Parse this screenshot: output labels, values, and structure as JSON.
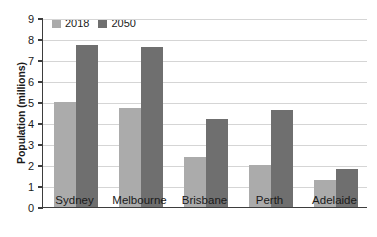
{
  "chart_data": {
    "type": "bar",
    "title": "",
    "xlabel": "",
    "ylabel": "Population (millions)",
    "categories": [
      "Sydney",
      "Melbourne",
      "Brisbane",
      "Perth",
      "Adelaide"
    ],
    "series": [
      {
        "name": "2018",
        "values": [
          5.0,
          4.7,
          2.4,
          2.0,
          1.3
        ],
        "color": "#ababab"
      },
      {
        "name": "2050",
        "values": [
          7.7,
          7.6,
          4.2,
          4.6,
          1.8
        ],
        "color": "#6f6f6f"
      }
    ],
    "ylim": [
      0,
      9
    ],
    "ytick_labels": [
      "0",
      "1",
      "2",
      "3",
      "4",
      "5",
      "6",
      "7",
      "8",
      "9"
    ],
    "ytick_values": [
      0,
      1,
      2,
      3,
      4,
      5,
      6,
      7,
      8,
      9
    ],
    "grid": true,
    "legend_position": "top-left",
    "axis_color": "#3d3d3d",
    "grid_color": "#d5d5d5",
    "background": "#ffffff"
  },
  "legend": {
    "items": [
      {
        "label": "2018",
        "color": "#ababab"
      },
      {
        "label": "2050",
        "color": "#6f6f6f"
      }
    ]
  }
}
